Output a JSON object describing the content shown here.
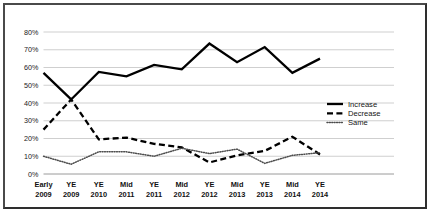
{
  "chart_data": {
    "type": "line",
    "title": "",
    "subtitle": "",
    "xlabel": "",
    "ylabel": "",
    "ylim": [
      0,
      80
    ],
    "ytick_labels": [
      "0%",
      "10%",
      "20%",
      "30%",
      "40%",
      "50%",
      "60%",
      "70%",
      "80%"
    ],
    "ytick_values": [
      0,
      10,
      20,
      30,
      40,
      50,
      60,
      70,
      80
    ],
    "grid": "horizontal",
    "legend_position": "right",
    "categories": [
      "Early 2009",
      "YE 2009",
      "YE 2010",
      "Mid 2011",
      "YE 2011",
      "Mid 2012",
      "YE 2012",
      "Mid 2013",
      "YE 2013",
      "Mid 2014",
      "YE 2014"
    ],
    "category_lines": [
      [
        "Early",
        "2009"
      ],
      [
        "YE",
        "2009"
      ],
      [
        "YE",
        "2010"
      ],
      [
        "Mid",
        "2011"
      ],
      [
        "YE",
        "2011"
      ],
      [
        "Mid",
        "2012"
      ],
      [
        "YE",
        "2012"
      ],
      [
        "Mid",
        "2013"
      ],
      [
        "YE",
        "2013"
      ],
      [
        "Mid",
        "2014"
      ],
      [
        "YE",
        "2014"
      ]
    ],
    "series": [
      {
        "name": "Increase",
        "style": "solid",
        "color": "#000000",
        "values": [
          57,
          42,
          57.5,
          55,
          61.5,
          59,
          73.5,
          63,
          71.5,
          57,
          65
        ]
      },
      {
        "name": "Decrease",
        "style": "dashed",
        "color": "#000000",
        "values": [
          25,
          42,
          19.5,
          20.5,
          17,
          15,
          6.5,
          10.5,
          13,
          21,
          11
        ]
      },
      {
        "name": "Same",
        "style": "dotted",
        "color": "#4d4d4d",
        "values": [
          10,
          5.5,
          12.5,
          12.5,
          10,
          14.5,
          11.5,
          14,
          6,
          10.5,
          12
        ]
      }
    ]
  },
  "legend": {
    "items": [
      {
        "label": "Increase",
        "style": "solid"
      },
      {
        "label": "Decrease",
        "style": "dashed"
      },
      {
        "label": "Same",
        "style": "dotted"
      }
    ]
  },
  "colors": {
    "frame_border": "#4a4a4a",
    "background": "#ffffff",
    "gridline": "#c9c9c9",
    "text": "#111111"
  }
}
